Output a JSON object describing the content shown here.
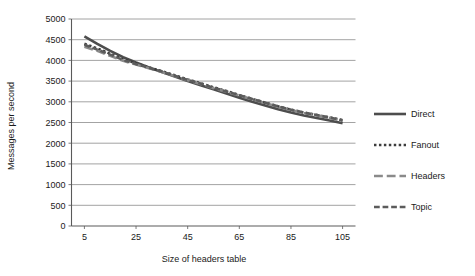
{
  "chart_data": {
    "type": "line",
    "title": "",
    "xlabel": "Size of headers table",
    "ylabel": "Messages per second",
    "xlim": [
      0,
      110
    ],
    "ylim": [
      0,
      5000
    ],
    "grid": true,
    "legend_position": "right",
    "xticks": [
      5,
      25,
      45,
      65,
      85,
      105
    ],
    "xtick_labels": [
      "5",
      "25",
      "45",
      "65",
      "85",
      "105"
    ],
    "yticks": [
      0,
      500,
      1000,
      1500,
      2000,
      2500,
      3000,
      3500,
      4000,
      4500,
      5000
    ],
    "ytick_labels": [
      "0",
      "500",
      "1000",
      "1500",
      "2000",
      "2500",
      "3000",
      "3500",
      "4000",
      "4500",
      "5000"
    ],
    "x": [
      5,
      10,
      15,
      20,
      25,
      30,
      35,
      40,
      45,
      50,
      55,
      60,
      65,
      70,
      75,
      80,
      85,
      90,
      95,
      100,
      105
    ],
    "series": [
      {
        "name": "Direct",
        "style": "solid",
        "color": "#4d4d4d",
        "width": 2.6,
        "values": [
          4580,
          4400,
          4230,
          4080,
          3950,
          3830,
          3720,
          3610,
          3500,
          3400,
          3300,
          3200,
          3100,
          3000,
          2910,
          2820,
          2740,
          2670,
          2610,
          2550,
          2480
        ]
      },
      {
        "name": "Fanout",
        "style": "dotted",
        "color": "#3d3d3d",
        "width": 2.6,
        "values": [
          4400,
          4290,
          4160,
          4030,
          3930,
          3830,
          3740,
          3640,
          3540,
          3450,
          3350,
          3260,
          3160,
          3070,
          2980,
          2890,
          2810,
          2740,
          2680,
          2620,
          2560
        ]
      },
      {
        "name": "Headers",
        "style": "dashed-long",
        "color": "#8a8a8a",
        "width": 2.6,
        "values": [
          4330,
          4230,
          4110,
          3990,
          3900,
          3810,
          3720,
          3620,
          3520,
          3430,
          3330,
          3240,
          3150,
          3060,
          2970,
          2880,
          2800,
          2730,
          2670,
          2610,
          2540
        ]
      },
      {
        "name": "Topic",
        "style": "dashed",
        "color": "#5c5c5c",
        "width": 2.6,
        "values": [
          4380,
          4260,
          4140,
          4010,
          3910,
          3820,
          3730,
          3630,
          3530,
          3440,
          3340,
          3250,
          3160,
          3070,
          2980,
          2890,
          2810,
          2740,
          2680,
          2620,
          2550
        ]
      }
    ]
  },
  "legend": {
    "items": [
      {
        "label": "Direct"
      },
      {
        "label": "Fanout"
      },
      {
        "label": "Headers"
      },
      {
        "label": "Topic"
      }
    ]
  }
}
